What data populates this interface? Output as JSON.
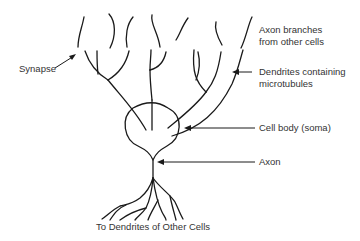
{
  "diagram": {
    "labels": {
      "synapse": "Synapse",
      "axon_branches_line1": "Axon branches",
      "axon_branches_line2": "from other cells",
      "dendrites_line1": "Dendrites containing",
      "dendrites_line2": "microtubules",
      "cell_body": "Cell body (soma)",
      "axon": "Axon",
      "bottom": "To Dendrites of Other Cells"
    },
    "colors": {
      "line": "#1a1a1a",
      "text": "#333333",
      "background": "#ffffff"
    }
  }
}
